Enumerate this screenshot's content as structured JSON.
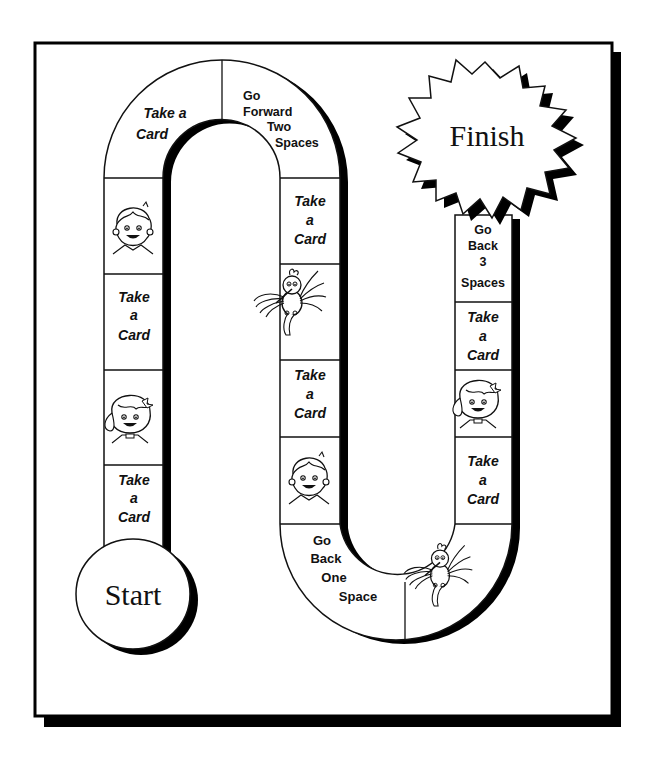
{
  "game": {
    "title": "Board Game Path",
    "start_label": "Start",
    "finish_label": "Finish",
    "colors": {
      "ink": "#000000",
      "paper": "#ffffff",
      "shadow": "#000000"
    }
  },
  "spaces": {
    "left_column": [
      {
        "id": "L1",
        "type": "picture",
        "icon": "boy-face-icon"
      },
      {
        "id": "L2",
        "type": "card",
        "lines": [
          "Take",
          "a",
          "Card"
        ]
      },
      {
        "id": "L3",
        "type": "picture",
        "icon": "girl-face-icon"
      },
      {
        "id": "L4",
        "type": "card",
        "lines": [
          "Take",
          "a",
          "Card"
        ]
      }
    ],
    "top_arch": [
      {
        "id": "T1",
        "type": "card",
        "lines": [
          "Take a",
          "Card"
        ]
      },
      {
        "id": "T2",
        "type": "move",
        "lines": [
          "Go",
          "Forward",
          "Two",
          "Spaces"
        ]
      }
    ],
    "middle_column": [
      {
        "id": "M1",
        "type": "card",
        "lines": [
          "Take",
          "a",
          "Card"
        ]
      },
      {
        "id": "M2",
        "type": "picture",
        "icon": "bird-icon"
      },
      {
        "id": "M3",
        "type": "card",
        "lines": [
          "Take",
          "a",
          "Card"
        ]
      },
      {
        "id": "M4",
        "type": "picture",
        "icon": "boy-face-icon"
      }
    ],
    "bottom_arch": [
      {
        "id": "B1",
        "type": "move",
        "lines": [
          "Go",
          "Back",
          "One",
          "Space"
        ]
      },
      {
        "id": "B2",
        "type": "picture",
        "icon": "bird-icon"
      }
    ],
    "right_column": [
      {
        "id": "R1",
        "type": "card",
        "lines": [
          "Take",
          "a",
          "Card"
        ]
      },
      {
        "id": "R2",
        "type": "picture",
        "icon": "girl-face-icon"
      },
      {
        "id": "R3",
        "type": "card",
        "lines": [
          "Take",
          "a",
          "Card"
        ]
      },
      {
        "id": "R4",
        "type": "move",
        "lines": [
          "Go",
          "Back",
          "3",
          "Spaces"
        ]
      }
    ]
  }
}
